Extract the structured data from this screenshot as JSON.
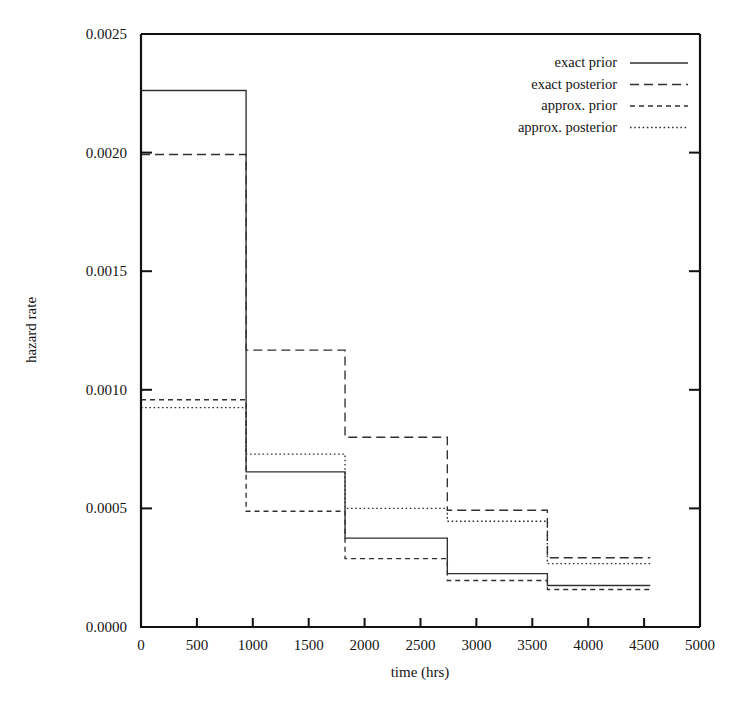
{
  "chart_data": {
    "type": "line",
    "title": "",
    "subtitle": "",
    "xlabel": "time (hrs)",
    "ylabel": "hazard rate",
    "xlim": [
      0,
      5000
    ],
    "ylim": [
      0.0,
      0.0025
    ],
    "grid": false,
    "legend_position": "top-right",
    "step_style": "post",
    "x_ticks": [
      0,
      500,
      1000,
      1500,
      2000,
      2500,
      3000,
      3500,
      4000,
      4500,
      5000
    ],
    "x_tick_labels": [
      "0",
      "500",
      "1000",
      "1500",
      "2000",
      "2500",
      "3000",
      "3500",
      "4000",
      "4500",
      "5000"
    ],
    "y_ticks": [
      0.0,
      0.0005,
      0.001,
      0.0015,
      0.002,
      0.0025
    ],
    "y_tick_labels": [
      "0.0000",
      "0.0005",
      "0.0010",
      "0.0015",
      "0.0020",
      "0.0025"
    ],
    "x_edges": [
      0,
      940,
      1825,
      2740,
      3635,
      4555
    ],
    "series": [
      {
        "name": "exact prior",
        "style": "solid",
        "values": [
          0.002262,
          0.000654,
          0.000375,
          0.000225,
          0.000175
        ]
      },
      {
        "name": "exact posterior",
        "style": "dashed",
        "values": [
          0.001992,
          0.001167,
          0.0008,
          0.000492,
          0.000292
        ]
      },
      {
        "name": "approx. prior",
        "style": "short-dash",
        "values": [
          0.000958,
          0.000488,
          0.000288,
          0.000196,
          0.000158
        ]
      },
      {
        "name": "approx. posterior",
        "style": "dotted",
        "values": [
          0.000925,
          0.000729,
          0.0005,
          0.000446,
          0.000267
        ]
      }
    ],
    "legend": [
      {
        "label": "exact prior",
        "style": "solid"
      },
      {
        "label": "exact posterior",
        "style": "dashed"
      },
      {
        "label": "approx. prior",
        "style": "short-dash"
      },
      {
        "label": "approx. posterior",
        "style": "dotted"
      }
    ]
  }
}
